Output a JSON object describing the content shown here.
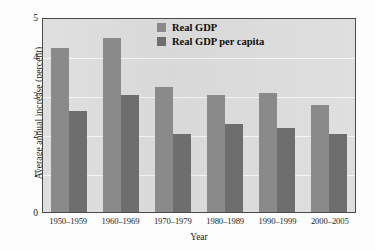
{
  "chart_data": {
    "type": "bar",
    "title": "",
    "categories": [
      "1950–1959",
      "1960–1969",
      "1970–1979",
      "1980–1989",
      "1990–1999",
      "2000–2005"
    ],
    "series": [
      {
        "name": "Real GDP",
        "color": "#8a8a8a",
        "values": [
          4.2,
          4.45,
          3.2,
          3.0,
          3.05,
          2.75
        ]
      },
      {
        "name": "Real GDP per capita",
        "color": "#6e6e6e",
        "values": [
          2.6,
          3.0,
          2.0,
          2.25,
          2.15,
          2.0
        ]
      }
    ],
    "xlabel": "Year",
    "ylabel": "Average annual increase (percent)",
    "ylim": [
      0,
      5
    ],
    "yticks": [
      0,
      1,
      2,
      3,
      4,
      5
    ],
    "ytick_labels": [
      "0",
      "1",
      "2",
      "3",
      "4",
      "5"
    ],
    "grid": true,
    "legend_position": "top-center",
    "plot_background": "#dcdcdc",
    "gridline_color": "#f4f4f4",
    "axis_color": "#4a4a4a",
    "page_background": "#fdfdfd"
  }
}
